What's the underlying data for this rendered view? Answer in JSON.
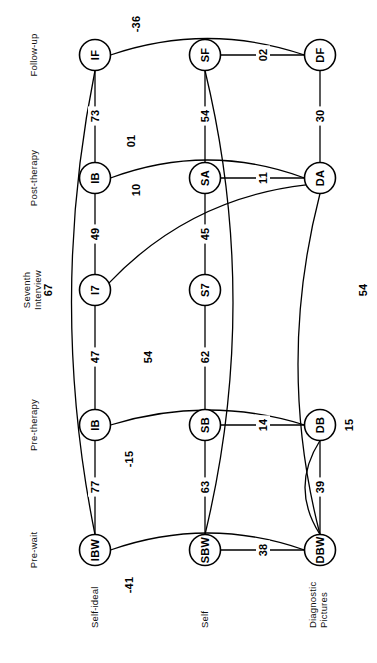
{
  "figure": {
    "orientation": "rotated-90-ccw",
    "column_labels": [
      "Pre-wait",
      "Pre-therapy",
      "Seventh Interview",
      "Post-therapy",
      "Follow-up"
    ],
    "row_labels": [
      "Self-ideal",
      "Self",
      "Diagnostic Pictures"
    ]
  },
  "nodes": [
    {
      "id": "IBW",
      "label": "IBW",
      "row": "Self-ideal",
      "col": "Pre-wait",
      "cx": 95,
      "cy": 550
    },
    {
      "id": "IB1",
      "label": "IB",
      "row": "Self-ideal",
      "col": "Pre-therapy",
      "cx": 95,
      "cy": 425
    },
    {
      "id": "I7",
      "label": "I7",
      "row": "Self-ideal",
      "col": "Seventh Interview",
      "cx": 95,
      "cy": 290
    },
    {
      "id": "IB2",
      "label": "IB",
      "row": "Self-ideal",
      "col": "Post-therapy",
      "cx": 95,
      "cy": 178
    },
    {
      "id": "IF",
      "label": "IF",
      "row": "Self-ideal",
      "col": "Follow-up",
      "cx": 95,
      "cy": 55
    },
    {
      "id": "SBW",
      "label": "SBW",
      "row": "Self",
      "col": "Pre-wait",
      "cx": 205,
      "cy": 550
    },
    {
      "id": "SB",
      "label": "SB",
      "row": "Self",
      "col": "Pre-therapy",
      "cx": 205,
      "cy": 425
    },
    {
      "id": "S7",
      "label": "S7",
      "row": "Self",
      "col": "Seventh Interview",
      "cx": 205,
      "cy": 290
    },
    {
      "id": "SA",
      "label": "SA",
      "row": "Self",
      "col": "Post-therapy",
      "cx": 205,
      "cy": 178
    },
    {
      "id": "SF",
      "label": "SF",
      "row": "Self",
      "col": "Follow-up",
      "cx": 205,
      "cy": 55
    },
    {
      "id": "DBW",
      "label": "DBW",
      "row": "Diagnostic Pictures",
      "col": "Pre-wait",
      "cx": 320,
      "cy": 550
    },
    {
      "id": "DB",
      "label": "DB",
      "row": "Diagnostic Pictures",
      "col": "Pre-therapy",
      "cx": 320,
      "cy": 425
    },
    {
      "id": "DA",
      "label": "DA",
      "row": "Diagnostic Pictures",
      "col": "Post-therapy",
      "cx": 320,
      "cy": 178
    },
    {
      "id": "DF",
      "label": "DF",
      "row": "Diagnostic Pictures",
      "col": "Follow-up",
      "cx": 320,
      "cy": 55
    }
  ],
  "edges": [
    {
      "from": "IBW",
      "to": "IB1",
      "value": "77",
      "lx": 95,
      "ly": 487
    },
    {
      "from": "IB1",
      "to": "I7",
      "value": "47",
      "lx": 95,
      "ly": 357
    },
    {
      "from": "I7",
      "to": "IB2",
      "value": "49",
      "lx": 95,
      "ly": 234
    },
    {
      "from": "IB2",
      "to": "IF",
      "value": "73",
      "lx": 95,
      "ly": 116
    },
    {
      "from": "SBW",
      "to": "SB",
      "value": "63",
      "lx": 205,
      "ly": 487
    },
    {
      "from": "SB",
      "to": "S7",
      "value": "62",
      "lx": 205,
      "ly": 357
    },
    {
      "from": "S7",
      "to": "SA",
      "value": "45",
      "lx": 205,
      "ly": 234
    },
    {
      "from": "SA",
      "to": "SF",
      "value": "54",
      "lx": 205,
      "ly": 116
    },
    {
      "from": "DBW",
      "to": "DB",
      "value": "39",
      "lx": 320,
      "ly": 487
    },
    {
      "from": "DA",
      "to": "DF",
      "value": "30",
      "lx": 320,
      "ly": 116
    },
    {
      "from": "SBW",
      "to": "DBW",
      "value": "38",
      "lx": 263,
      "ly": 550
    },
    {
      "from": "SB",
      "to": "DB",
      "value": "14",
      "lx": 263,
      "ly": 425
    },
    {
      "from": "SA",
      "to": "DA",
      "value": "11",
      "lx": 263,
      "ly": 178
    },
    {
      "from": "SF",
      "to": "DF",
      "value": "02",
      "lx": 263,
      "ly": 55
    },
    {
      "from": "IBW",
      "to": "DBW",
      "value": "-41",
      "lx": 129,
      "ly": 585
    },
    {
      "from": "IBW",
      "to": "IF",
      "value": "67",
      "lx": 48,
      "ly": 290
    },
    {
      "from": "IF",
      "to": "DF",
      "value": "-36",
      "lx": 136,
      "ly": 24
    },
    {
      "from": "IB1",
      "to": "DB",
      "value": "-15",
      "lx": 129,
      "ly": 459
    },
    {
      "from": "IB2",
      "to": "DA",
      "value": "01",
      "lx": 131,
      "ly": 141
    },
    {
      "from": "I7",
      "to": "DA",
      "value": "10",
      "lx": 136,
      "ly": 190
    },
    {
      "from": "SF",
      "to": "SBW",
      "value": "54",
      "lx": 148,
      "ly": 357
    },
    {
      "from": "DA",
      "to": "DBW",
      "value": "54",
      "lx": 363,
      "ly": 290
    },
    {
      "from": "DB",
      "to": "DBW",
      "value": "15",
      "lx": 349,
      "ly": 425
    }
  ]
}
